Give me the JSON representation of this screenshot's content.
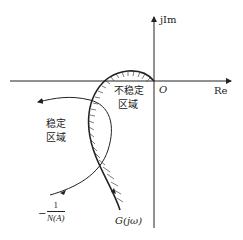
{
  "diagram": {
    "type": "nyquist-describing-function-stability",
    "axes": {
      "real_label": "Re",
      "imag_label": "jIm",
      "origin_label": "O"
    },
    "regions": {
      "unstable": [
        "不稳定",
        "区域"
      ],
      "stable": [
        "稳定",
        "区域"
      ]
    },
    "curves": {
      "g_label": "G(jω)",
      "nyquist_minus": "−",
      "na_numerator": "1",
      "na_denominator": "N(A)"
    },
    "colors": {
      "line": "#222222",
      "hatch": "#444444",
      "background": "#ffffff"
    }
  }
}
